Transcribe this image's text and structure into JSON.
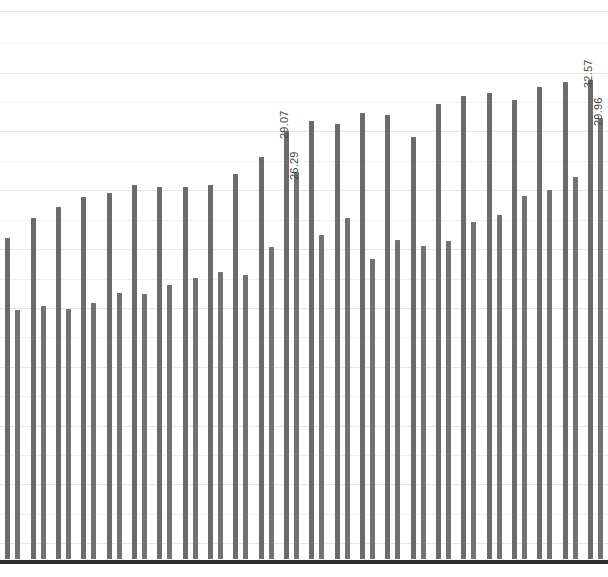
{
  "chart_data": {
    "type": "bar",
    "title": "",
    "subtitle": "",
    "xlabel": "",
    "ylabel": "",
    "grid": true,
    "legend": false,
    "legend_position": "none",
    "ylim": [
      0,
      38
    ],
    "xlim": [
      0,
      24
    ],
    "bar_color": "#6b6b6b",
    "baseline_color": "#2e2e2e",
    "gridline_color": "#e9e9e9",
    "axis_tick_labels_visible": false,
    "categories": [
      "1",
      "2",
      "3",
      "4",
      "5",
      "6",
      "7",
      "8",
      "9",
      "10",
      "11",
      "12",
      "13",
      "14",
      "15",
      "16",
      "17",
      "18",
      "19",
      "20",
      "21",
      "22",
      "23",
      "24"
    ],
    "series": [
      {
        "name": "tall",
        "values": [
          21.8,
          23.2,
          23.9,
          24.6,
          24.9,
          25.4,
          25.3,
          25.3,
          25.4,
          26.2,
          27.3,
          29.07,
          29.8,
          29.6,
          30.3,
          30.2,
          28.7,
          30.9,
          31.5,
          31.7,
          31.2,
          32.1,
          32.4,
          32.57
        ]
      },
      {
        "name": "short",
        "values": [
          16.9,
          17.2,
          17.0,
          17.4,
          18.1,
          18.0,
          18.6,
          19.1,
          19.5,
          19.3,
          21.2,
          26.29,
          22.0,
          23.2,
          20.4,
          21.7,
          21.3,
          21.6,
          22.9,
          23.4,
          24.7,
          25.1,
          26.0,
          29.96
        ]
      }
    ],
    "annotations": [
      {
        "label": "29.07",
        "series": "tall",
        "index": 11,
        "value": 29.07
      },
      {
        "label": "26.29",
        "series": "short",
        "index": 11,
        "value": 26.29
      },
      {
        "label": "32.57",
        "series": "tall",
        "index": 23,
        "value": 32.57
      },
      {
        "label": "29.96",
        "series": "short",
        "index": 23,
        "value": 29.96
      }
    ],
    "gridline_values": [
      37.2,
      35.0,
      33.0,
      31.0,
      29.0,
      27.0,
      25.0,
      23.0,
      21.0,
      19.0,
      17.0,
      15.0,
      13.0,
      11.0,
      9.0,
      7.0,
      5.0,
      3.0,
      1.0
    ]
  }
}
